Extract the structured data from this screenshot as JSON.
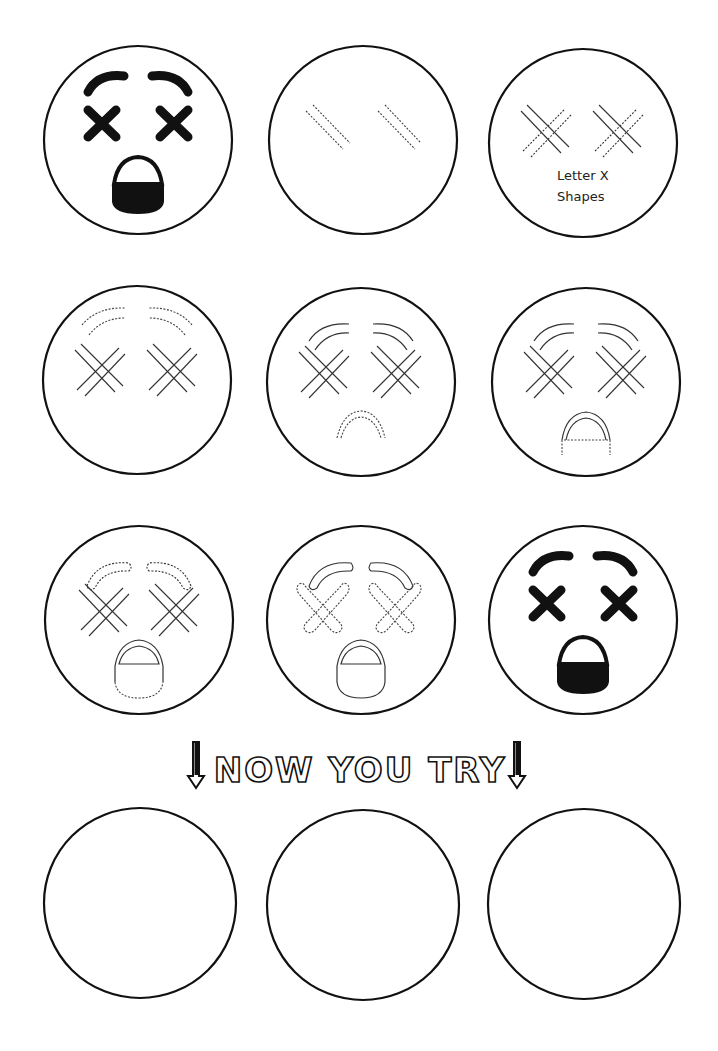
{
  "worksheet": {
    "title": "How to Draw a Dizzy Emoji",
    "colors": {
      "ink": "#111111",
      "paper": "#ffffff",
      "guide": "#444444"
    },
    "steps": [
      {
        "step": 1,
        "description": "Finished dizzy emoji with black X eyes, eyebrows and open mouth"
      },
      {
        "step": 2,
        "description": "Dashed diagonal guide lines for eyes"
      },
      {
        "step": 3,
        "description": "Crossing lines forming X eyes",
        "annotation_line1": "Letter X",
        "annotation_line2": "Shapes"
      },
      {
        "step": 4,
        "description": "Dashed arcs for eyebrows"
      },
      {
        "step": 5,
        "description": "Dashed arc for top of mouth"
      },
      {
        "step": 6,
        "description": "Dashed sides and line of mouth"
      },
      {
        "step": 7,
        "description": "Dashed bottom curve of mouth and eyebrow outlines"
      },
      {
        "step": 8,
        "description": "Dashed outlines of thick X eyes"
      },
      {
        "step": 9,
        "description": "Final colored dizzy emoji"
      }
    ],
    "banner": {
      "text": "NOW YOU TRY",
      "left_arrow": "down-arrow-icon",
      "right_arrow": "down-arrow-icon"
    },
    "practice_circles": [
      {
        "label": "practice-1"
      },
      {
        "label": "practice-2"
      },
      {
        "label": "practice-3"
      }
    ]
  }
}
